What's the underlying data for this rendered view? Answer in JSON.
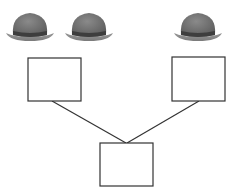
{
  "diagram": {
    "type": "family-tree-style",
    "hats": [
      {
        "id": "hat-1",
        "icon": "bowler-hat-icon",
        "x": 30,
        "color_crown": "#6f6f6f",
        "color_brim": "#8a8a8a",
        "color_band": "#3e3e3e"
      },
      {
        "id": "hat-2",
        "icon": "bowler-hat-icon",
        "x": 89,
        "color_crown": "#6f6f6f",
        "color_brim": "#8a8a8a",
        "color_band": "#3e3e3e"
      },
      {
        "id": "hat-3",
        "icon": "bowler-hat-icon",
        "x": 198,
        "color_crown": "#6f6f6f",
        "color_brim": "#8a8a8a",
        "color_band": "#3e3e3e"
      }
    ],
    "boxes": [
      {
        "id": "box-left",
        "label": "",
        "x": 28,
        "y": 58,
        "w": 53,
        "h": 43
      },
      {
        "id": "box-right",
        "label": "",
        "x": 172,
        "y": 57,
        "w": 53,
        "h": 44
      },
      {
        "id": "box-bottom",
        "label": "",
        "x": 100,
        "y": 143,
        "w": 53,
        "h": 43
      }
    ],
    "connectors": [
      {
        "from": "box-left",
        "to": "box-bottom"
      },
      {
        "from": "box-right",
        "to": "box-bottom"
      }
    ],
    "stroke_color": "#333333"
  }
}
